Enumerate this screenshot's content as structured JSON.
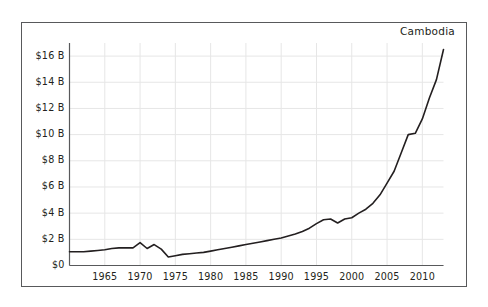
{
  "chart_data": {
    "type": "line",
    "title": "Cambodia",
    "title_position": "top-right",
    "xlabel": "",
    "ylabel": "",
    "grid": true,
    "legend": "none",
    "xlim": [
      1960,
      2013
    ],
    "ylim": [
      0,
      17
    ],
    "y_unit": "billion US dollars",
    "yticks": [
      0,
      2,
      4,
      6,
      8,
      10,
      12,
      14,
      16
    ],
    "ytick_labels": [
      "$0",
      "$2 B",
      "$4 B",
      "$6 B",
      "$8 B",
      "$10 B",
      "$12 B",
      "$14 B",
      "$16 B"
    ],
    "xticks": [
      1965,
      1970,
      1975,
      1980,
      1985,
      1990,
      1995,
      2000,
      2005,
      2010
    ],
    "xtick_labels": [
      "1965",
      "1970",
      "1975",
      "1980",
      "1985",
      "1990",
      "1995",
      "2000",
      "2005",
      "2010"
    ],
    "series": [
      {
        "name": "Cambodia",
        "color": "#231f20",
        "x": [
          1960,
          1961,
          1962,
          1963,
          1964,
          1965,
          1966,
          1967,
          1968,
          1969,
          1970,
          1971,
          1972,
          1973,
          1974,
          1975,
          1976,
          1977,
          1978,
          1979,
          1980,
          1981,
          1982,
          1983,
          1984,
          1985,
          1986,
          1987,
          1988,
          1989,
          1990,
          1991,
          1992,
          1993,
          1994,
          1995,
          1996,
          1997,
          1998,
          1999,
          2000,
          2001,
          2002,
          2003,
          2004,
          2005,
          2006,
          2007,
          2008,
          2009,
          2010,
          2011,
          2012,
          2013
        ],
        "values": [
          1.05,
          1.05,
          1.05,
          1.1,
          1.15,
          1.2,
          1.3,
          1.35,
          1.35,
          1.35,
          1.75,
          1.3,
          1.6,
          1.25,
          0.65,
          0.75,
          0.85,
          0.9,
          0.95,
          1.0,
          1.1,
          1.2,
          1.3,
          1.4,
          1.5,
          1.6,
          1.7,
          1.8,
          1.9,
          2.0,
          2.1,
          2.25,
          2.4,
          2.6,
          2.85,
          3.2,
          3.5,
          3.55,
          3.25,
          3.55,
          3.65,
          4.0,
          4.3,
          4.75,
          5.4,
          6.3,
          7.2,
          8.6,
          10.0,
          10.1,
          11.2,
          12.8,
          14.2,
          16.5
        ]
      }
    ]
  },
  "axes": {
    "y_labels": [
      "$16 B",
      "$14 B",
      "$12 B",
      "$10 B",
      "$8 B",
      "$6 B",
      "$4 B",
      "$2 B",
      "$0"
    ],
    "x_labels": [
      "1965",
      "1970",
      "1975",
      "1980",
      "1985",
      "1990",
      "1995",
      "2000",
      "2005",
      "2010"
    ]
  },
  "style": {
    "line_color": "#231f20",
    "grid_color": "#e6e6e6",
    "axis_color": "#58595b",
    "frame_color": "#58595b",
    "background": "#ffffff"
  }
}
